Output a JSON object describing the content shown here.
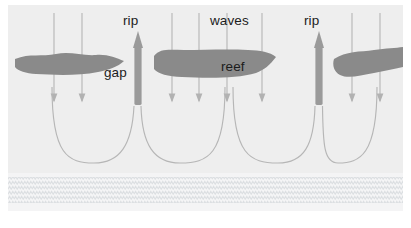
{
  "figure": {
    "kind": "rip-current-reef-diagram",
    "panel": {
      "background_color": "#eeeeee",
      "width": 395,
      "height": 206,
      "outer_background": "#ffffff"
    },
    "beach": {
      "label": "",
      "fill_color": "#f4f4f4",
      "stipple_color": "#d9dcdf",
      "top_y": 168,
      "height": 38
    },
    "colors": {
      "reef": "#8a8a8a",
      "rip_arrow": "#9a9a9a",
      "wave_arrow": "#b0b0b0",
      "feeder_current": "#b4b4b4",
      "text": "#1c1c1c"
    },
    "labels": [
      {
        "name": "rip-label-left",
        "text": "rip",
        "x": 115,
        "y": 9
      },
      {
        "name": "waves-label",
        "text": "waves",
        "x": 202,
        "y": 9
      },
      {
        "name": "rip-label-right",
        "text": "rip",
        "x": 296,
        "y": 9
      },
      {
        "name": "gap-label",
        "text": "gap",
        "x": 96,
        "y": 61
      },
      {
        "name": "reef-label",
        "text": "reef",
        "x": 213,
        "y": 55
      }
    ],
    "reefs": [
      {
        "name": "reef-left",
        "description": "elongated irregular reef bar at left"
      },
      {
        "name": "reef-middle",
        "description": "broad irregular reef bar in centre, labelled reef"
      },
      {
        "name": "reef-right",
        "description": "hook shaped reef bar at right edge"
      }
    ],
    "rip_currents": [
      {
        "name": "rip-current-left",
        "x": 130,
        "top_y": 28,
        "bottom_y": 100,
        "direction": "offshore"
      },
      {
        "name": "rip-current-right",
        "x": 311,
        "top_y": 28,
        "bottom_y": 100,
        "direction": "offshore"
      }
    ],
    "wave_arrows": {
      "direction": "onshore",
      "x_positions": [
        46,
        74,
        164,
        191,
        219,
        254,
        344,
        372
      ],
      "top_y": 8,
      "bottom_y": 98
    },
    "feeder_currents": {
      "count": 4,
      "description": "curved alongshore feeder currents converging into the rip necks"
    }
  }
}
